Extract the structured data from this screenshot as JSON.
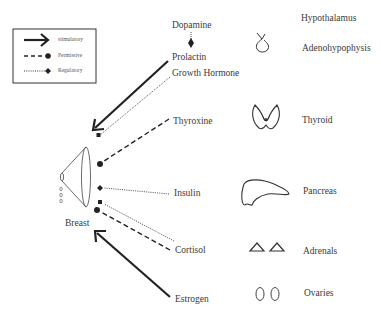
{
  "legend": {
    "items": [
      {
        "label": "stimulatory",
        "style": "solid-arrow"
      },
      {
        "label": "Permissive",
        "style": "dashed-circle"
      },
      {
        "label": "Regulatory",
        "style": "dotted-diamond"
      }
    ]
  },
  "target": {
    "label": "Breast",
    "icon": "breast-cone-icon"
  },
  "hormones": [
    {
      "label": "Dopamine",
      "relation": "regulatory",
      "target": "Prolactin"
    },
    {
      "label": "Prolactin",
      "relation": "stimulatory"
    },
    {
      "label": "Growth Hormone",
      "relation": "regulatory"
    },
    {
      "label": "Thyroxine",
      "relation": "permissive"
    },
    {
      "label": "Insulin",
      "relation": "regulatory"
    },
    {
      "label": "Cortisol",
      "relation": "permissive+regulatory"
    },
    {
      "label": "Estrogen",
      "relation": "stimulatory"
    }
  ],
  "glands": [
    {
      "label": "Hypothalamus",
      "icon": ""
    },
    {
      "label": "Adenohypophysis",
      "icon": "pituitary-icon"
    },
    {
      "label": "Thyroid",
      "icon": "thyroid-icon"
    },
    {
      "label": "Pancreas",
      "icon": "pancreas-icon"
    },
    {
      "label": "Adrenals",
      "icon": "adrenals-icon"
    },
    {
      "label": "Ovaries",
      "icon": "ovaries-icon"
    }
  ],
  "colors": {
    "line": "#222222",
    "text": "#3a3a3a"
  }
}
